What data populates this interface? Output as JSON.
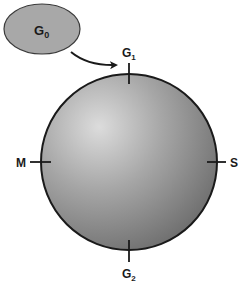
{
  "diagram": {
    "type": "cell-cycle",
    "outside_state": {
      "label": "G",
      "subscript": "0"
    },
    "cycle_phases": [
      {
        "id": "g1",
        "label": "G",
        "subscript": "1",
        "position": "top"
      },
      {
        "id": "s",
        "label": "S",
        "subscript": "",
        "position": "right"
      },
      {
        "id": "g2",
        "label": "G",
        "subscript": "2",
        "position": "bottom"
      },
      {
        "id": "m",
        "label": "M",
        "subscript": "",
        "position": "left"
      }
    ],
    "arrow": {
      "from": "G0",
      "to": "G1"
    },
    "colors": {
      "ellipse_fill": "#a8a8a8",
      "sphere_light": "#d9d9d9",
      "sphere_dark": "#6e6e6e",
      "stroke": "#1a1a1a"
    }
  }
}
